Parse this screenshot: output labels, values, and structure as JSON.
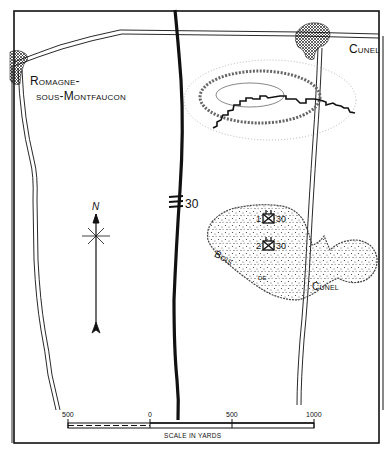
{
  "map": {
    "title": "Bois de Cunel area map",
    "places": {
      "romagne_line1": "Romagne-",
      "romagne_line2": "sous-Montfaucon",
      "cunel_village": "Cunel",
      "wood_bois": "Bois",
      "wood_de": "de",
      "wood_cunel": "Cunel"
    },
    "boundary_label": "30",
    "units": [
      {
        "number": "1",
        "division": "30"
      },
      {
        "number": "2",
        "division": "30"
      }
    ],
    "north_arrow": {
      "label": "N"
    },
    "scale": {
      "ticks": [
        "500",
        "0",
        "500",
        "1000"
      ],
      "title": "SCALE IN YARDS"
    },
    "colors": {
      "ink": "#111111",
      "paper": "#ffffff"
    }
  }
}
